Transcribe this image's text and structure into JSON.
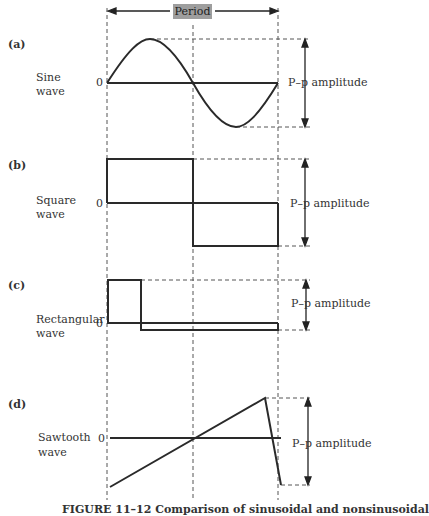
{
  "period_label": "Period",
  "panels": [
    {
      "tag": "(a)",
      "name_line1": "Sine",
      "name_line2": "wave",
      "zero": "0",
      "amplitude_label": "P–p amplitude"
    },
    {
      "tag": "(b)",
      "name_line1": "Square",
      "name_line2": "wave",
      "zero": "0",
      "amplitude_label": "P–p amplitude"
    },
    {
      "tag": "(c)",
      "name_line1": "Rectangular",
      "name_line2": "wave",
      "zero": "0",
      "amplitude_label": "P–p amplitude"
    },
    {
      "tag": "(d)",
      "name_line1": "Sawtooth",
      "name_line2": "wave",
      "zero": "0",
      "amplitude_label": "P–p amplitude"
    }
  ],
  "caption": "FIGURE 11–12  Comparison of sinusoidal and nonsinusoidal",
  "colors": {
    "line": "#2a2a2a",
    "period_box": "#9e9e9e"
  }
}
